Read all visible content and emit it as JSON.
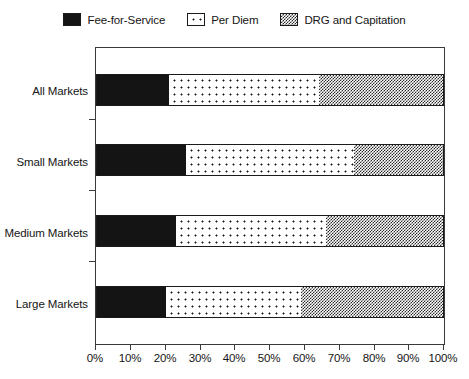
{
  "chart_data": {
    "type": "bar",
    "orientation": "horizontal",
    "stacked": true,
    "title": "",
    "subtitle": "",
    "xlabel": "",
    "ylabel": "",
    "xlim": [
      0,
      100
    ],
    "xticks": [
      "0%",
      "10%",
      "20%",
      "30%",
      "40%",
      "50%",
      "60%",
      "70%",
      "80%",
      "90%",
      "100%"
    ],
    "grid": false,
    "legend_position": "top-center",
    "categories": [
      "All Markets",
      "Small Markets",
      "Medium Markets",
      "Large Markets"
    ],
    "series": [
      {
        "name": "Fee-for-Service",
        "fill": "solid-black",
        "values": [
          21,
          26,
          23,
          20
        ]
      },
      {
        "name": "Per Diem",
        "fill": "white-dots",
        "values": [
          43,
          48,
          43,
          39
        ]
      },
      {
        "name": "DRG and Capitation",
        "fill": "gray-checker",
        "values": [
          36,
          26,
          34,
          41
        ]
      }
    ]
  },
  "legend": {
    "items": [
      {
        "label": "Fee-for-Service"
      },
      {
        "label": "Per Diem"
      },
      {
        "label": "DRG and Capitation"
      }
    ]
  },
  "axes": {
    "x_tick_labels": [
      "0%",
      "10%",
      "20%",
      "30%",
      "40%",
      "50%",
      "60%",
      "70%",
      "80%",
      "90%",
      "100%"
    ],
    "y_tick_labels": [
      "All Markets",
      "Small Markets",
      "Medium Markets",
      "Large Markets"
    ]
  },
  "colors": {
    "series_fee_for_service": "#141414",
    "series_per_diem": "#ffffff",
    "series_drg_capitation": "#7a7a7a",
    "axis": "#3a3a3a",
    "text": "#151515",
    "background": "#ffffff"
  }
}
